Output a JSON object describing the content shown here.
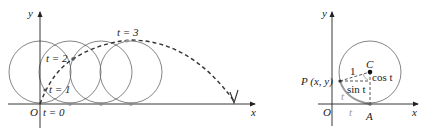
{
  "left_panel": {
    "axis_labels": {
      "x": "x",
      "y": "y",
      "origin": "O"
    },
    "time_labels": {
      "t0": "t = 0",
      "t1": "t = 1",
      "t2": "t = 2",
      "t3": "t = 3"
    },
    "circles": [
      {
        "cx": 40,
        "cy": 72,
        "r": 31
      },
      {
        "cx": 70,
        "cy": 72,
        "r": 31
      },
      {
        "cx": 101,
        "cy": 72,
        "r": 31
      },
      {
        "cx": 131,
        "cy": 72,
        "r": 31
      }
    ],
    "contact_points": [
      {
        "x": 70,
        "y": 104
      },
      {
        "x": 101,
        "y": 104
      },
      {
        "x": 131,
        "y": 104
      }
    ],
    "curve_points": [
      {
        "x": 45,
        "y": 90
      },
      {
        "x": 73,
        "y": 59
      },
      {
        "x": 127,
        "y": 41
      }
    ],
    "curve_style": "dashed"
  },
  "right_panel": {
    "axis_labels": {
      "x": "x",
      "y": "y",
      "origin": "O"
    },
    "point_labels": {
      "P": "P (x, y)",
      "C": "C",
      "A": "A"
    },
    "segment_labels": {
      "radius": "1",
      "cos": "cos t",
      "sin": "sin t",
      "arc": "t",
      "base": "t"
    },
    "circle": {
      "cx": 370,
      "cy": 72,
      "r": 31
    }
  },
  "colors": {
    "stroke": "#333333",
    "circle": "#666666",
    "dot": "#8a8a8a",
    "arc_grey": "#9a9a9a"
  }
}
